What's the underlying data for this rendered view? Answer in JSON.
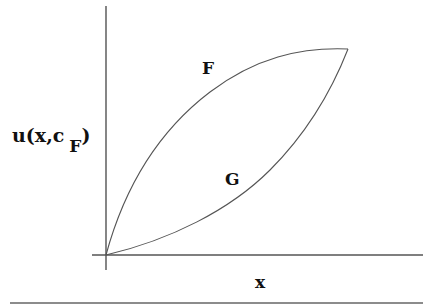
{
  "diagram": {
    "y_axis_label": {
      "main": "u(x,c",
      "subscript": "F",
      "close": ")"
    },
    "x_axis_label": "x",
    "curves": [
      {
        "name": "F",
        "label": "F",
        "shape": "concave, rising steeply from origin to meeting point"
      },
      {
        "name": "G",
        "label": "G",
        "shape": "convex, rising slowly from origin to meeting point"
      }
    ],
    "colors": {
      "axis": "#444444",
      "curve": "#555555",
      "text": "#111111",
      "background": "#ffffff"
    }
  }
}
